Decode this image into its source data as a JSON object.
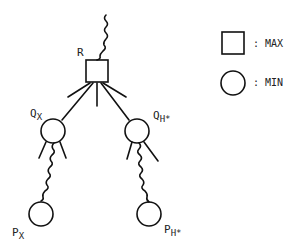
{
  "diagram": {
    "nodes": [
      {
        "id": "R",
        "label": "R",
        "sub": "",
        "shape": "square",
        "type": "MAX"
      },
      {
        "id": "QX",
        "label": "Q",
        "sub": "X",
        "shape": "circle",
        "type": "MIN"
      },
      {
        "id": "QH",
        "label": "Q",
        "sub": "H*",
        "shape": "circle",
        "type": "MIN"
      },
      {
        "id": "PX",
        "label": "P",
        "sub": "X",
        "shape": "circle",
        "type": "MIN"
      },
      {
        "id": "PH",
        "label": "P",
        "sub": "H*",
        "shape": "circle",
        "type": "MIN"
      }
    ],
    "edges": [
      {
        "from": "R",
        "to": "QX",
        "style": "straight"
      },
      {
        "from": "R",
        "to": "QH",
        "style": "straight"
      },
      {
        "from": "QX",
        "to": "PX",
        "style": "wavy"
      },
      {
        "from": "QH",
        "to": "PH",
        "style": "wavy"
      }
    ]
  },
  "legend": {
    "max_label": ": MAX",
    "min_label": ": MIN"
  }
}
